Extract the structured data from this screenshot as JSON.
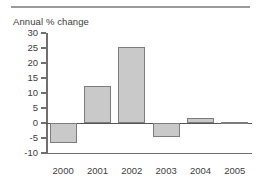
{
  "chart_data": {
    "type": "bar",
    "title": "Annual % change",
    "xlabel": "",
    "ylabel": "",
    "categories": [
      "2000",
      "2001",
      "2002",
      "2003",
      "2004",
      "2005"
    ],
    "values": [
      -6.5,
      12.3,
      25.5,
      -4.5,
      1.7,
      0.0
    ],
    "series": [
      {
        "name": "Annual % change",
        "values": [
          -6.5,
          12.3,
          25.5,
          -4.5,
          1.7,
          0.0
        ]
      }
    ],
    "ylim": [
      -10,
      30
    ],
    "ytick_labels": [
      "30",
      "25",
      "20",
      "15",
      "10",
      "5",
      "0",
      "-5",
      "-10"
    ],
    "ytick_values": [
      30,
      25,
      20,
      15,
      10,
      5,
      0,
      -5,
      -10
    ],
    "grid": false,
    "legend": null,
    "legend_position": "none",
    "zero_line": true,
    "bar_fill_color": "#c9c9c9",
    "bar_border_color": "#7d7d7d",
    "axis_color": "#6f6f6f",
    "text_color": "#3d3d3d",
    "background_color": "#ffffff",
    "rule_color": "#9a9a9a"
  }
}
